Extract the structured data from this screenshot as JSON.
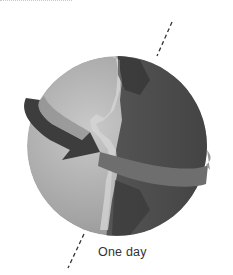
{
  "figure": {
    "caption": "One day",
    "elements": [
      "globe-icon",
      "rotation-arrow-icon",
      "axis-line",
      "day-night-terminator"
    ]
  },
  "colors": {
    "day_side": "#a8a8a8",
    "night_side": "#4a4a4a",
    "arrow": "#6a6a6a",
    "axis": "#333333",
    "caption": "#333333"
  }
}
